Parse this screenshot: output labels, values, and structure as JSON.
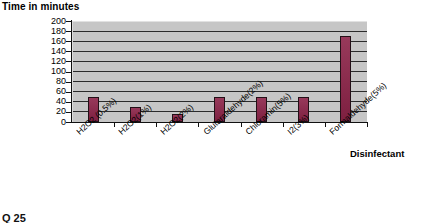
{
  "chart_data": {
    "type": "bar",
    "title": "",
    "ylabel": "Time in minutes",
    "xlabel": "Disinfectant",
    "ylim": [
      0,
      200
    ],
    "ytick_step": 20,
    "yticks": [
      200,
      180,
      160,
      140,
      120,
      100,
      80,
      60,
      40,
      20,
      0
    ],
    "grid": true,
    "legend": "none",
    "categories": [
      "H2O2 (0.5%)",
      "H2O2(1%)",
      "H2O2(2%)",
      "Glutaraldehyde(2%)",
      "Chloramin(5%)",
      "I2(3%)",
      "Formaldehyde(5%)"
    ],
    "values": [
      50,
      30,
      15,
      50,
      50,
      50,
      170
    ],
    "series": [
      {
        "name": "Time in minutes",
        "values": [
          50,
          30,
          15,
          50,
          50,
          50,
          170
        ]
      }
    ],
    "colors": {
      "bar": "#8c2348",
      "bar_border": "#231017",
      "plot_background": "#c6c6c6",
      "gridline": "#2b2b2b",
      "axis": "#111111",
      "text": "#000000",
      "page_background": "#ffffff"
    }
  },
  "artifact": {
    "bottom_mark": "Q 25"
  }
}
